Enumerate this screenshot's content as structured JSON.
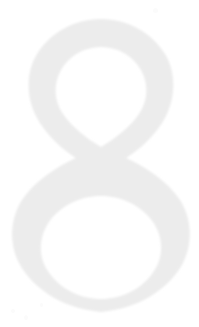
{
  "page": {
    "width": 199,
    "height": 327,
    "background_color": "#ffffff"
  },
  "glyph": {
    "character": "8",
    "name": "numeral-eight",
    "fill_color": "#ececec",
    "edge_color": "#f2f2f2",
    "style": "serif-oldstyle-outline-faded",
    "bounds": {
      "left": 8,
      "top": 18,
      "right": 191,
      "bottom": 312
    },
    "upper_bowl": {
      "apex_x": 101,
      "apex_y": 19,
      "left_x": 17,
      "right_x": 173,
      "waist_y": 170
    },
    "lower_bowl": {
      "vertex_x": 101,
      "vertex_y": 311,
      "left_x": 8,
      "right_x": 191,
      "waist_y": 170
    },
    "waist": {
      "center_x": 101,
      "center_y": 170
    }
  },
  "artifacts": {
    "label": "scan-specks",
    "color": "#fbfbfb",
    "items": [
      {
        "name": "speck-top-right",
        "x": 153,
        "y": 8
      },
      {
        "name": "speck-bottom-left-a",
        "x": 11,
        "y": 309
      },
      {
        "name": "speck-bottom-left-b",
        "x": 24,
        "y": 315
      },
      {
        "name": "speck-bottom-left-c",
        "x": 40,
        "y": 303
      }
    ]
  }
}
